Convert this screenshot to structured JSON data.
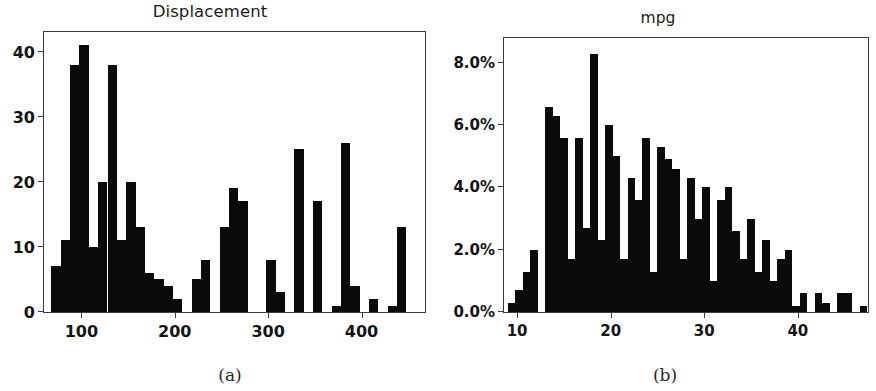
{
  "figure": {
    "panels": [
      {
        "key": "a",
        "title": "Displacement",
        "subcaption": "(a)"
      },
      {
        "key": "b",
        "title": "mpg",
        "subcaption": "(b)"
      }
    ]
  },
  "chart_data": [
    {
      "type": "bar",
      "title": "Displacement",
      "subcaption": "(a)",
      "xlabel": "",
      "ylabel": "",
      "ylim": [
        0,
        43
      ],
      "xlim": [
        60,
        468
      ],
      "grid": false,
      "legend": "none",
      "yticks": [
        0,
        10,
        20,
        30,
        40
      ],
      "ytick_labels": [
        "0",
        "10",
        "20",
        "30",
        "40"
      ],
      "xticks": [
        100,
        200,
        300,
        400
      ],
      "xtick_labels": [
        "100",
        "200",
        "300",
        "400"
      ],
      "bin_width": 10,
      "bin_starts": [
        68,
        78,
        88,
        98,
        108,
        118,
        128,
        138,
        148,
        158,
        168,
        178,
        188,
        198,
        208,
        218,
        228,
        238,
        248,
        258,
        268,
        298,
        308,
        318,
        328,
        338,
        348,
        358,
        368,
        378,
        388,
        398,
        408,
        428,
        438,
        448
      ],
      "categories": [
        "68",
        "78",
        "88",
        "98",
        "108",
        "118",
        "128",
        "138",
        "148",
        "158",
        "168",
        "178",
        "188",
        "198",
        "208",
        "218",
        "228",
        "238",
        "248",
        "258",
        "268",
        "298",
        "308",
        "318",
        "328",
        "338",
        "348",
        "358",
        "368",
        "378",
        "388",
        "398",
        "408",
        "428",
        "438",
        "448"
      ],
      "values": [
        7,
        11,
        38,
        41,
        10,
        20,
        38,
        11,
        20,
        13,
        6,
        5,
        4,
        2,
        0,
        5,
        8,
        0,
        13,
        19,
        17,
        8,
        3,
        0,
        25,
        0,
        17,
        0,
        1,
        26,
        4,
        0,
        2,
        1,
        13,
        0,
        3,
        2,
        4
      ]
    },
    {
      "type": "bar",
      "title": "mpg",
      "subcaption": "(b)",
      "xlabel": "",
      "ylabel": "",
      "ylim": [
        0,
        0.088
      ],
      "xlim": [
        8.6,
        47.5
      ],
      "grid": false,
      "legend": "none",
      "yticks": [
        0.0,
        0.02,
        0.04,
        0.06,
        0.08
      ],
      "ytick_labels": [
        "0.0%",
        "2.0%",
        "4.0%",
        "6.0%",
        "8.0%"
      ],
      "xticks": [
        10,
        20,
        30,
        40
      ],
      "xtick_labels": [
        "10",
        "20",
        "30",
        "40"
      ],
      "bin_width": 0.8,
      "units": "percent",
      "categories": [
        "9.0",
        "9.8",
        "10.6",
        "11.4",
        "12.2",
        "13.0",
        "13.8",
        "14.6",
        "15.4",
        "16.2",
        "17.0",
        "17.8",
        "18.6",
        "19.4",
        "20.2",
        "21.0",
        "21.8",
        "22.6",
        "23.4",
        "24.2",
        "25.0",
        "25.8",
        "26.6",
        "27.4",
        "28.2",
        "29.0",
        "29.8",
        "30.6",
        "31.4",
        "32.2",
        "33.0",
        "33.8",
        "34.6",
        "35.4",
        "36.2",
        "37.0",
        "37.8",
        "38.6",
        "39.4",
        "40.2",
        "41.0",
        "41.8",
        "42.6",
        "43.4",
        "44.2",
        "45.0",
        "45.8",
        "46.6"
      ],
      "values": [
        0.3,
        0.7,
        1.3,
        2.0,
        0.0,
        6.6,
        6.3,
        5.6,
        1.7,
        5.6,
        2.7,
        8.3,
        2.3,
        6.0,
        5.0,
        1.7,
        4.3,
        3.6,
        5.6,
        1.3,
        5.3,
        4.9,
        4.6,
        1.7,
        4.3,
        3.0,
        4.0,
        1.0,
        3.6,
        4.0,
        2.6,
        1.7,
        3.0,
        1.3,
        2.3,
        1.0,
        1.7,
        2.0,
        0.2,
        0.6,
        0.0,
        0.6,
        0.3,
        0.0,
        0.6,
        0.6,
        0.0,
        0.2
      ]
    }
  ]
}
